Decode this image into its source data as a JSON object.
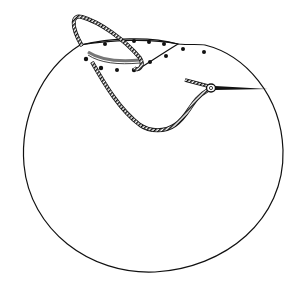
{
  "figure": {
    "title": "",
    "description": "Line illustration of a suture technique: a large circle with a crescent-shaped flap at the top marked with dots, a striped thread looping through the flap, and a needle on the right.",
    "colors": {
      "line": "#111111",
      "background": "#ffffff",
      "flap_shade": "#777777"
    },
    "circle": {
      "cx": 153,
      "cy": 157,
      "r": 129
    },
    "dots": [
      [
        105,
        44
      ],
      [
        134,
        41
      ],
      [
        149,
        42
      ],
      [
        164,
        44
      ],
      [
        183,
        49
      ],
      [
        204,
        52
      ],
      [
        86,
        59
      ],
      [
        101,
        68
      ],
      [
        117,
        70
      ],
      [
        134,
        70
      ],
      [
        150,
        62
      ],
      [
        166,
        56
      ]
    ],
    "elements": [
      "circle-outline",
      "flap",
      "dots",
      "suture-thread",
      "needle"
    ]
  }
}
